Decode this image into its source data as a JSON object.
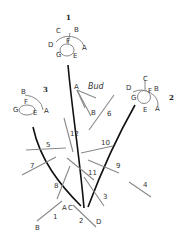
{
  "figure": {
    "bud_label": "Bud",
    "flowers": [
      {
        "id": "1",
        "labels": [
          "A",
          "B",
          "C",
          "D",
          "E",
          "F",
          "G"
        ]
      },
      {
        "id": "2",
        "labels": [
          "A",
          "B",
          "C",
          "D",
          "E",
          "F",
          "G"
        ]
      },
      {
        "id": "3",
        "labels": [
          "A",
          "B",
          "E",
          "F",
          "G"
        ]
      }
    ],
    "bud_points": [
      "A",
      "B"
    ],
    "leaves": [
      "1",
      "2",
      "3",
      "4",
      "5",
      "6",
      "7",
      "8",
      "9",
      "10",
      "11",
      "12"
    ],
    "base_labels": [
      "A",
      "B",
      "C",
      "D"
    ],
    "colors": {
      "stem": "#111111",
      "leaf": "#888888",
      "text": "#333333"
    }
  }
}
